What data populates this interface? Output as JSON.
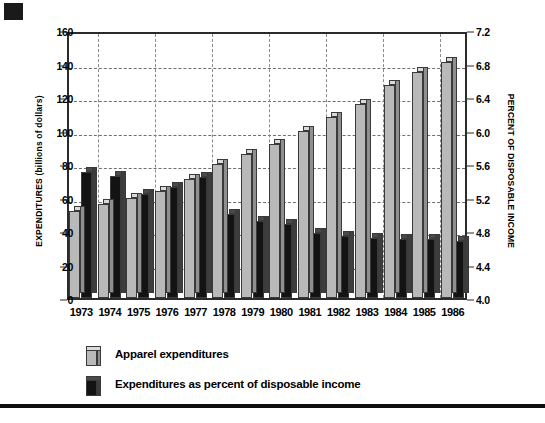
{
  "chart_data": {
    "type": "bar",
    "title": "",
    "subtitle": "",
    "categories": [
      "1973",
      "1974",
      "1975",
      "1976",
      "1977",
      "1978",
      "1979",
      "1980",
      "1981",
      "1982",
      "1983",
      "1984",
      "1985",
      "1986"
    ],
    "xlabel": "",
    "ylabel": "EXPENDITURES (billions of dollars)",
    "ylabel_secondary": "PERCENT OF DISPOSABLE INCOME",
    "ylim": [
      0,
      160
    ],
    "ylim_secondary": [
      4.0,
      7.2
    ],
    "yticks": [
      "0",
      "20",
      "40",
      "60",
      "80",
      "100",
      "120",
      "140",
      "160"
    ],
    "yticks_secondary": [
      "4.0",
      "4.4",
      "4.8",
      "5.2",
      "5.6",
      "6.0",
      "6.4",
      "6.8",
      "7.2"
    ],
    "grid": true,
    "legend_position": "below-plot",
    "series": [
      {
        "name": "Apparel expenditures",
        "axis": "left",
        "unit": "billions of dollars",
        "color": "#b9b9b9",
        "values": [
          52,
          56,
          60,
          64,
          71,
          80,
          86,
          92,
          100,
          108,
          116,
          127,
          135,
          141
        ]
      },
      {
        "name": "Expenditures as percent of disposable income",
        "axis": "right",
        "unit": "percent",
        "color": "#131313",
        "values": [
          5.5,
          5.46,
          5.24,
          5.32,
          5.44,
          5.0,
          4.92,
          4.88,
          4.78,
          4.74,
          4.72,
          4.7,
          4.7,
          4.68
        ]
      }
    ]
  },
  "legend": {
    "items": [
      {
        "label": "Apparel expenditures",
        "swatch": "light"
      },
      {
        "label": "Expenditures as percent of disposable income",
        "swatch": "dark"
      }
    ]
  }
}
